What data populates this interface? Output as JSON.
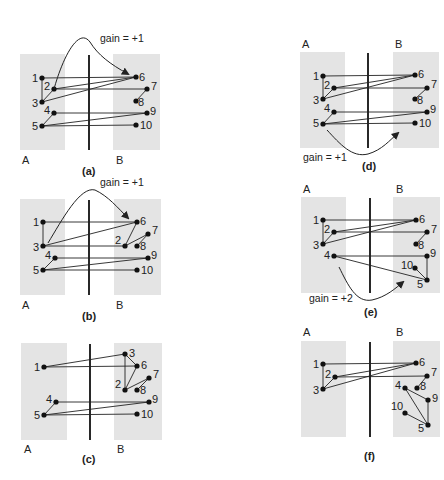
{
  "figure": {
    "side_labels": {
      "left": "A",
      "right": "B"
    },
    "panels": [
      {
        "id": "a",
        "caption": "(a)",
        "gain_label": "gain = +1",
        "box_a": [
          20,
          54,
          45,
          96
        ],
        "box_b": [
          113,
          54,
          47,
          96
        ],
        "divider": [
          89,
          55,
          89,
          150
        ],
        "side_label_pos": {
          "A": [
            22,
            164
          ],
          "B": [
            116,
            164
          ]
        },
        "caption_pos": [
          82,
          175
        ],
        "gain_pos": [
          100,
          42
        ],
        "arrow": {
          "path": "M54,89 C62,60 78,26 90,42 C98,55 110,64 128,74",
          "head": [
            130,
            76
          ]
        },
        "nodes": {
          "1": {
            "x": 42,
            "y": 78,
            "lx": -10,
            "ly": 4
          },
          "2": {
            "x": 54,
            "y": 89,
            "lx": -10,
            "ly": 1
          },
          "3": {
            "x": 42,
            "y": 102,
            "lx": -10,
            "ly": 5
          },
          "4": {
            "x": 54,
            "y": 113,
            "lx": -10,
            "ly": 1
          },
          "5": {
            "x": 42,
            "y": 126,
            "lx": -10,
            "ly": 4
          },
          "6": {
            "x": 136,
            "y": 77,
            "lx": 3,
            "ly": 4
          },
          "7": {
            "x": 147,
            "y": 89,
            "lx": 4,
            "ly": 1
          },
          "8": {
            "x": 136,
            "y": 101,
            "lx": 2,
            "ly": 5
          },
          "9": {
            "x": 147,
            "y": 113,
            "lx": 3,
            "ly": 2
          },
          "10": {
            "x": 136,
            "y": 125,
            "lx": 4,
            "ly": 4
          }
        },
        "edges": [
          [
            "1",
            "6"
          ],
          [
            "1",
            "3"
          ],
          [
            "2",
            "6"
          ],
          [
            "2",
            "7"
          ],
          [
            "2",
            "3"
          ],
          [
            "3",
            "6"
          ],
          [
            "4",
            "9"
          ],
          [
            "4",
            "5"
          ],
          [
            "5",
            "9"
          ],
          [
            "5",
            "10"
          ],
          [
            "7",
            "8"
          ]
        ]
      },
      {
        "id": "b",
        "caption": "(b)",
        "gain_label": "gain = +1",
        "box_a": [
          20,
          199,
          45,
          96
        ],
        "box_b": [
          114,
          199,
          47,
          96
        ],
        "divider": [
          89,
          200,
          89,
          295
        ],
        "side_label_pos": {
          "A": [
            22,
            309
          ],
          "B": [
            116,
            309
          ]
        },
        "caption_pos": [
          82,
          320
        ],
        "gain_pos": [
          100,
          186
        ],
        "arrow": {
          "path": "M48,243 C62,220 80,186 95,190 C108,196 118,208 128,218",
          "head": [
            130,
            220
          ]
        },
        "nodes": {
          "1": {
            "x": 43,
            "y": 222,
            "lx": -10,
            "ly": 4
          },
          "3": {
            "x": 43,
            "y": 246,
            "lx": -10,
            "ly": 5
          },
          "4": {
            "x": 55,
            "y": 258,
            "lx": -10,
            "ly": 1
          },
          "5": {
            "x": 43,
            "y": 270,
            "lx": -10,
            "ly": 4
          },
          "6": {
            "x": 137,
            "y": 222,
            "lx": 3,
            "ly": 3
          },
          "7": {
            "x": 148,
            "y": 234,
            "lx": 4,
            "ly": 0
          },
          "2": {
            "x": 125,
            "y": 246,
            "lx": -10,
            "ly": -2
          },
          "8": {
            "x": 137,
            "y": 246,
            "lx": 3,
            "ly": 4
          },
          "9": {
            "x": 148,
            "y": 258,
            "lx": 3,
            "ly": 1
          },
          "10": {
            "x": 137,
            "y": 270,
            "lx": 4,
            "ly": 4
          }
        },
        "edges": [
          [
            "1",
            "6"
          ],
          [
            "1",
            "3"
          ],
          [
            "3",
            "6"
          ],
          [
            "3",
            "2"
          ],
          [
            "2",
            "6"
          ],
          [
            "2",
            "7"
          ],
          [
            "7",
            "8"
          ],
          [
            "4",
            "9"
          ],
          [
            "4",
            "5"
          ],
          [
            "5",
            "9"
          ],
          [
            "5",
            "10"
          ]
        ]
      },
      {
        "id": "c",
        "caption": "(c)",
        "gain_label": "",
        "box_a": [
          21,
          343,
          46,
          97
        ],
        "box_b": [
          114,
          343,
          48,
          97
        ],
        "divider": [
          90,
          344,
          90,
          440
        ],
        "side_label_pos": {
          "A": [
            24,
            453
          ],
          "B": [
            117,
            453
          ]
        },
        "caption_pos": [
          82,
          463
        ],
        "nodes": {
          "1": {
            "x": 44,
            "y": 367,
            "lx": -10,
            "ly": 4
          },
          "3": {
            "x": 125,
            "y": 354,
            "lx": 4,
            "ly": 3
          },
          "6": {
            "x": 137,
            "y": 366,
            "lx": 4,
            "ly": 3
          },
          "7": {
            "x": 149,
            "y": 378,
            "lx": 4,
            "ly": 0
          },
          "2": {
            "x": 125,
            "y": 390,
            "lx": -10,
            "ly": -2
          },
          "8": {
            "x": 137,
            "y": 390,
            "lx": 3,
            "ly": 4
          },
          "4": {
            "x": 56,
            "y": 402,
            "lx": -10,
            "ly": 1
          },
          "9": {
            "x": 149,
            "y": 402,
            "lx": 3,
            "ly": 1
          },
          "5": {
            "x": 44,
            "y": 415,
            "lx": -10,
            "ly": 4
          },
          "10": {
            "x": 137,
            "y": 414,
            "lx": 4,
            "ly": 4
          }
        },
        "edges": [
          [
            "1",
            "3"
          ],
          [
            "1",
            "6"
          ],
          [
            "3",
            "6"
          ],
          [
            "3",
            "2"
          ],
          [
            "2",
            "6"
          ],
          [
            "2",
            "7"
          ],
          [
            "7",
            "8"
          ],
          [
            "4",
            "9"
          ],
          [
            "4",
            "5"
          ],
          [
            "5",
            "9"
          ],
          [
            "5",
            "10"
          ]
        ]
      },
      {
        "id": "d",
        "caption": "(d)",
        "gain_label": "gain = +1",
        "box_a": [
          300,
          52,
          45,
          96
        ],
        "box_b": [
          393,
          52,
          46,
          96
        ],
        "divider": [
          368,
          53,
          368,
          148
        ],
        "side_label_pos": {
          "A": [
            302,
            48
          ],
          "B": [
            395,
            48
          ]
        },
        "caption_pos": [
          362,
          170
        ],
        "gain_pos": [
          303,
          161
        ],
        "arrow": {
          "path": "M327,130 C340,144 352,158 368,154 C382,150 390,140 398,133",
          "head": [
            400,
            131
          ]
        },
        "nodes": {
          "1": {
            "x": 323,
            "y": 76,
            "lx": -10,
            "ly": 4
          },
          "2": {
            "x": 334,
            "y": 88,
            "lx": -10,
            "ly": 1
          },
          "3": {
            "x": 323,
            "y": 99,
            "lx": -10,
            "ly": 5
          },
          "4": {
            "x": 334,
            "y": 112,
            "lx": -10,
            "ly": 0
          },
          "5": {
            "x": 323,
            "y": 124,
            "lx": -10,
            "ly": 3
          },
          "6": {
            "x": 415,
            "y": 75,
            "lx": 3,
            "ly": 3
          },
          "7": {
            "x": 427,
            "y": 88,
            "lx": 4,
            "ly": 0
          },
          "8": {
            "x": 415,
            "y": 99,
            "lx": 2,
            "ly": 5
          },
          "9": {
            "x": 427,
            "y": 112,
            "lx": 3,
            "ly": 1
          },
          "10": {
            "x": 415,
            "y": 123,
            "lx": 4,
            "ly": 4
          }
        },
        "edges": [
          [
            "1",
            "6"
          ],
          [
            "1",
            "3"
          ],
          [
            "2",
            "6"
          ],
          [
            "2",
            "7"
          ],
          [
            "2",
            "3"
          ],
          [
            "3",
            "6"
          ],
          [
            "4",
            "9"
          ],
          [
            "4",
            "5"
          ],
          [
            "5",
            "9"
          ],
          [
            "5",
            "10"
          ],
          [
            "7",
            "8"
          ]
        ]
      },
      {
        "id": "e",
        "caption": "(e)",
        "gain_label": "gain = +2",
        "box_a": [
          301,
          197,
          45,
          96
        ],
        "box_b": [
          393,
          197,
          47,
          96
        ],
        "divider": [
          370,
          198,
          370,
          293
        ],
        "side_label_pos": {
          "A": [
            303,
            193
          ],
          "B": [
            396,
            193
          ]
        },
        "caption_pos": [
          364,
          316
        ],
        "gain_pos": [
          309,
          302
        ],
        "arrow": {
          "path": "M339,267 C348,285 356,303 372,300 C386,297 396,288 403,282",
          "head": [
            405,
            280
          ]
        },
        "nodes": {
          "1": {
            "x": 323,
            "y": 220,
            "lx": -10,
            "ly": 4
          },
          "2": {
            "x": 334,
            "y": 232,
            "lx": -10,
            "ly": 1
          },
          "3": {
            "x": 323,
            "y": 244,
            "lx": -10,
            "ly": 5
          },
          "4": {
            "x": 334,
            "y": 256,
            "lx": -10,
            "ly": 3
          },
          "6": {
            "x": 416,
            "y": 220,
            "lx": 3,
            "ly": 3
          },
          "7": {
            "x": 427,
            "y": 232,
            "lx": 4,
            "ly": 1
          },
          "8": {
            "x": 416,
            "y": 244,
            "lx": 2,
            "ly": 5
          },
          "9": {
            "x": 427,
            "y": 256,
            "lx": 3,
            "ly": 1
          },
          "10": {
            "x": 415,
            "y": 268,
            "lx": -14,
            "ly": 1
          },
          "5": {
            "x": 427,
            "y": 280,
            "lx": -10,
            "ly": 8
          }
        },
        "edges": [
          [
            "1",
            "6"
          ],
          [
            "1",
            "3"
          ],
          [
            "2",
            "6"
          ],
          [
            "2",
            "7"
          ],
          [
            "2",
            "3"
          ],
          [
            "3",
            "6"
          ],
          [
            "4",
            "9"
          ],
          [
            "4",
            "5"
          ],
          [
            "9",
            "5"
          ],
          [
            "10",
            "5"
          ],
          [
            "7",
            "8"
          ]
        ]
      },
      {
        "id": "f",
        "caption": "(f)",
        "gain_label": "",
        "box_a": [
          301,
          341,
          45,
          96
        ],
        "box_b": [
          393,
          341,
          47,
          96
        ],
        "divider": [
          370,
          342,
          370,
          437
        ],
        "side_label_pos": {
          "A": [
            303,
            336
          ],
          "B": [
            396,
            336
          ]
        },
        "caption_pos": [
          364,
          460
        ],
        "nodes": {
          "1": {
            "x": 323,
            "y": 364,
            "lx": -10,
            "ly": 4
          },
          "2": {
            "x": 335,
            "y": 377,
            "lx": -10,
            "ly": 1
          },
          "3": {
            "x": 323,
            "y": 389,
            "lx": -10,
            "ly": 5
          },
          "6": {
            "x": 416,
            "y": 363,
            "lx": 3,
            "ly": 3
          },
          "7": {
            "x": 427,
            "y": 376,
            "lx": 4,
            "ly": 0
          },
          "4": {
            "x": 405,
            "y": 388,
            "lx": -10,
            "ly": 1
          },
          "8": {
            "x": 417,
            "y": 388,
            "lx": 3,
            "ly": 2
          },
          "9": {
            "x": 428,
            "y": 400,
            "lx": 4,
            "ly": 2
          },
          "10": {
            "x": 405,
            "y": 413,
            "lx": -14,
            "ly": -3
          },
          "5": {
            "x": 428,
            "y": 425,
            "lx": -10,
            "ly": 7
          }
        },
        "edges": [
          [
            "1",
            "6"
          ],
          [
            "1",
            "3"
          ],
          [
            "2",
            "6"
          ],
          [
            "2",
            "7"
          ],
          [
            "2",
            "3"
          ],
          [
            "3",
            "6"
          ],
          [
            "4",
            "9"
          ],
          [
            "4",
            "5"
          ],
          [
            "9",
            "5"
          ],
          [
            "10",
            "5"
          ],
          [
            "7",
            "8"
          ]
        ]
      }
    ]
  }
}
